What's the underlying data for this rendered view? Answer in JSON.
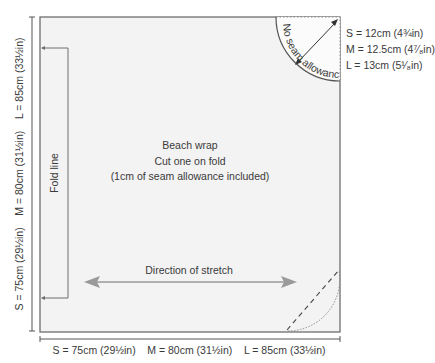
{
  "diagram": {
    "type": "sewing-pattern",
    "piece": {
      "title": "Beach wrap",
      "instruction": "Cut one on fold",
      "note": "(1cm of seam allowance included)"
    },
    "fold_line_label": "Fold line",
    "stretch_label": "Direction of stretch",
    "corner_label": "No seam allowance",
    "corner_radius_sizes": [
      "S = 12cm (4¾in)",
      "M = 12.5cm (4⁷⁄₈in)",
      "L = 13cm (5¹⁄₈in)"
    ],
    "height_dimension": "S = 75cm (29½in)    M = 80cm (31½in)    L = 85cm (33½in)",
    "width_dimension": "S = 75cm (29½in)    M = 80cm (31½in)    L = 85cm (33½in)",
    "colors": {
      "piece_fill": "#f3f3f3",
      "outline": "#6e6e6e",
      "arrow": "#9a9a9a",
      "text": "#3a3a3a"
    }
  }
}
